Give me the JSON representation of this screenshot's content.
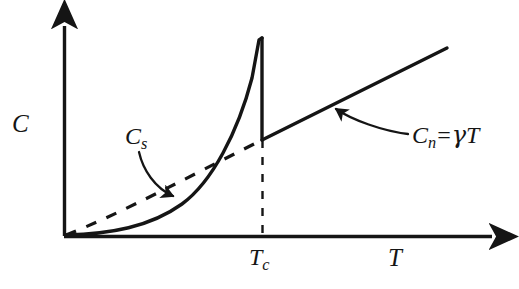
{
  "figure": {
    "type": "diagram",
    "background_color": "#ffffff",
    "ink_color": "#151515"
  },
  "axes": {
    "y_axis": {
      "name": "vertical-axis",
      "label": "C",
      "arrow": "up",
      "x_px": 64,
      "top_px": 18,
      "bottom_px": 236
    },
    "x_axis": {
      "name": "horizontal-axis",
      "label": "T",
      "arrow": "right",
      "y_px": 236,
      "left_px": 64,
      "right_px": 503
    },
    "origin": {
      "x": 64,
      "y": 236
    }
  },
  "ticks": {
    "critical_temperature": {
      "label": "T",
      "subscript": "c",
      "x_px": 262,
      "guide_line_style": "dashed"
    }
  },
  "curves": {
    "superconducting": {
      "name": "superconducting-specific-heat-curve",
      "label": "C",
      "subscript": "s",
      "style": "solid",
      "description": "exponential rise from origin to a sharp peak at Tc, then vertical drop to the normal-state line",
      "peak": {
        "x": 262,
        "y": 38
      },
      "drop_to": {
        "x": 262,
        "y": 140
      }
    },
    "normal": {
      "name": "normal-state-specific-heat-line",
      "label_full": "C",
      "subscript": "n",
      "equals": "=",
      "gamma": "γ",
      "variable": "T",
      "style": "solid",
      "description": "straight line of slope gamma starting at (Tc, gamma*Tc) extending to upper right",
      "from": {
        "x": 262,
        "y": 140
      },
      "to": {
        "x": 447,
        "y": 48
      }
    },
    "normal_extrapolation": {
      "name": "normal-state-extrapolation",
      "style": "dashed",
      "description": "dashed extension of the gamma*T line from the origin to (Tc, gamma*Tc)",
      "from": {
        "x": 64,
        "y": 236
      },
      "to": {
        "x": 262,
        "y": 140
      }
    }
  },
  "annotations": [
    {
      "name": "cs-annotation",
      "label_main": "C",
      "label_sub": "s",
      "arrow": "curved, pointing down-right to the solid superconducting curve",
      "label_pos": {
        "x": 125,
        "y": 124
      },
      "arrow_tip": {
        "x": 180,
        "y": 199
      }
    },
    {
      "name": "cn-annotation",
      "label_main": "C",
      "label_sub": "n",
      "label_rest": "= γT",
      "arrow": "curved, pointing up-left to the normal-state line",
      "label_pos": {
        "x": 412,
        "y": 123
      },
      "arrow_tip": {
        "x": 330,
        "y": 107
      }
    }
  ],
  "labels": {
    "c_axis": "C",
    "t_axis": "T",
    "tc_main": "T",
    "tc_sub": "c",
    "cs_main": "C",
    "cs_sub": "s",
    "cn_main": "C",
    "cn_sub": "n",
    "cn_equals": "=",
    "cn_gamma": "γ",
    "cn_t": "T"
  }
}
